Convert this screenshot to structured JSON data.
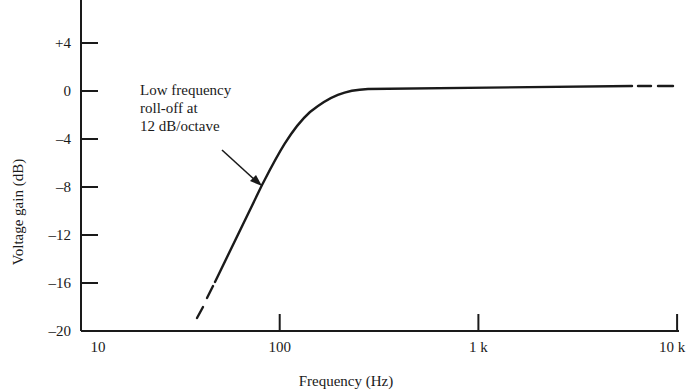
{
  "chart_data": {
    "type": "line",
    "title": "",
    "xlabel": "Frequency (Hz)",
    "ylabel": "Voltage gain (dB)",
    "xscale": "log",
    "xlim": [
      10,
      10000
    ],
    "ylim": [
      -20,
      8
    ],
    "x_ticks": [
      {
        "value": 10,
        "label": "10"
      },
      {
        "value": 100,
        "label": "100"
      },
      {
        "value": 1000,
        "label": "1 k"
      },
      {
        "value": 10000,
        "label": "10 k"
      }
    ],
    "y_ticks": [
      {
        "value": 4,
        "label": "+4"
      },
      {
        "value": 0,
        "label": "0"
      },
      {
        "value": -4,
        "label": "–4"
      },
      {
        "value": -8,
        "label": "–8"
      },
      {
        "value": -12,
        "label": "–12"
      },
      {
        "value": -16,
        "label": "–16"
      },
      {
        "value": -20,
        "label": "–20"
      }
    ],
    "grid": false,
    "legend": null,
    "series": [
      {
        "name": "Voltage gain",
        "points": [
          {
            "x": 38,
            "y": -19.0,
            "style": "dashed"
          },
          {
            "x": 48,
            "y": -15.5,
            "style": "solid"
          },
          {
            "x": 70,
            "y": -9.5
          },
          {
            "x": 85,
            "y": -7.7
          },
          {
            "x": 100,
            "y": -5.0
          },
          {
            "x": 150,
            "y": -1.5
          },
          {
            "x": 200,
            "y": -0.3
          },
          {
            "x": 300,
            "y": 0.1
          },
          {
            "x": 1000,
            "y": 0.2
          },
          {
            "x": 3000,
            "y": 0.3
          },
          {
            "x": 5000,
            "y": 0.4,
            "style": "dashed"
          },
          {
            "x": 10000,
            "y": 0.4
          }
        ]
      }
    ],
    "annotations": [
      {
        "text_lines": [
          "Low frequency",
          "roll-off at",
          "12 dB/octave"
        ],
        "arrow_to": {
          "x": 85,
          "y": -7.7
        }
      }
    ]
  }
}
